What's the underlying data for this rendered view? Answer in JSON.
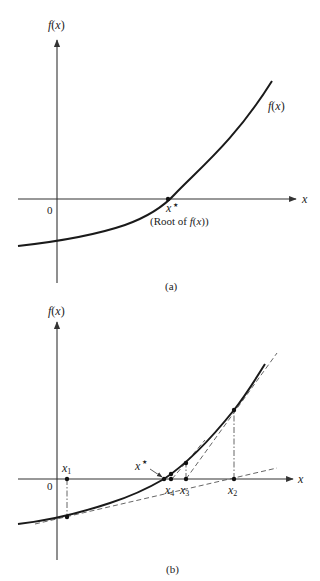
{
  "panel_a": {
    "caption": "(a)",
    "y_axis_label": "f(x)",
    "x_axis_label": "x",
    "origin_label": "0",
    "curve_label": "f(x)",
    "root_label": "x",
    "root_star": "★",
    "root_note": "(Root of f(x))"
  },
  "panel_b": {
    "caption": "(b)",
    "y_axis_label": "f(x)",
    "x_axis_label": "x",
    "origin_label": "0",
    "root_label": "x",
    "root_star": "★",
    "iterates": [
      {
        "name": "x",
        "sub": "1"
      },
      {
        "name": "x",
        "sub": "2"
      },
      {
        "name": "x",
        "sub": "3"
      },
      {
        "name": "x",
        "sub": "4"
      }
    ]
  },
  "colors": {
    "ink": "#1a1a1a",
    "axis": "#333333",
    "guide": "#555555",
    "background": "#ffffff"
  }
}
